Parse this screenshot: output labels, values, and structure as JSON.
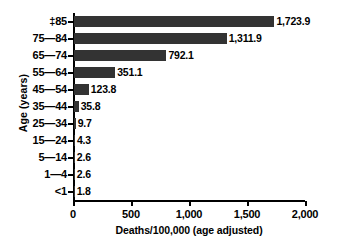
{
  "chart_data": {
    "type": "bar",
    "orientation": "horizontal",
    "title": "",
    "xlabel": "Deaths/100,000 (age adjusted)",
    "ylabel": "Age (years)",
    "xlim": [
      0,
      2000
    ],
    "xticks": [
      "0",
      "500",
      "1,000",
      "1,500",
      "2,000"
    ],
    "xtick_values": [
      0,
      500,
      1000,
      1500,
      2000
    ],
    "grid": false,
    "legend": null,
    "bar_color": "#333333",
    "categories": [
      "‡85",
      "75—84",
      "65—74",
      "55—64",
      "45—54",
      "35—44",
      "25—34",
      "15—24",
      "5—14",
      "1—4",
      "<1"
    ],
    "values": [
      1723.9,
      1311.9,
      792.1,
      351.1,
      123.8,
      35.8,
      9.7,
      4.3,
      2.6,
      2.6,
      1.8
    ],
    "value_labels": [
      "1,723.9",
      "1,311.9",
      "792.1",
      "351.1",
      "123.8",
      "35.8",
      "9.7",
      "4.3",
      "2.6",
      "2.6",
      "1.8"
    ]
  }
}
